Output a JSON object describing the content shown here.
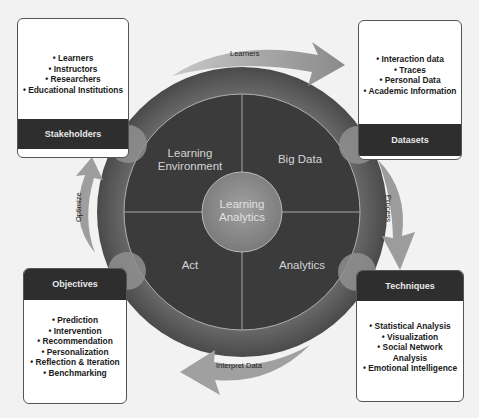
{
  "diagram": {
    "center": {
      "label_line1": "Learning",
      "label_line2": "Analytics"
    },
    "quadrants": [
      {
        "id": "learning-environment",
        "line1": "Learning",
        "line2": "Environment"
      },
      {
        "id": "big-data",
        "line1": "Big Data",
        "line2": ""
      },
      {
        "id": "act",
        "line1": "Act",
        "line2": ""
      },
      {
        "id": "analytics",
        "line1": "Analytics",
        "line2": ""
      }
    ],
    "boxes": {
      "stakeholders": {
        "title": "Stakeholders",
        "items": [
          "• Learners",
          "• Instructors",
          "• Researchers",
          "• Educational Institutions"
        ]
      },
      "datasets": {
        "title": "Datasets",
        "items": [
          "• Interaction data",
          "• Traces",
          "• Personal Data",
          "• Academic Information"
        ]
      },
      "objectives": {
        "title": "Objectives",
        "items": [
          "• Prediction",
          "• Intervention",
          "• Recommendation",
          "• Personalization",
          "• Reflection & Iteration",
          "• Benchmarking"
        ]
      },
      "techniques": {
        "title": "Techniques",
        "items": [
          "• Statistical Analysis",
          "• Visualization",
          "• Social Network",
          "Analysis",
          "• Emotional Intelligence"
        ]
      }
    },
    "arrows": {
      "top": "Learners",
      "right": "Process",
      "bottom": "Interpret Data",
      "left": "Optimize"
    },
    "colors": {
      "ring_outer": "#5a5a5a",
      "disc": "#3a3a3a",
      "center_circle": "#8a8a8a",
      "arrow": "#9a9a9a",
      "header": "#2e2e2e"
    }
  }
}
